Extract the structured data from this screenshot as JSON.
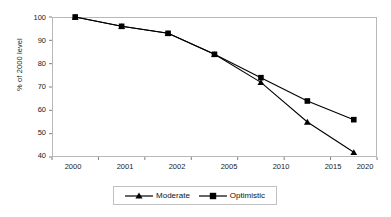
{
  "chart_data": {
    "type": "line",
    "title": "",
    "xlabel": "",
    "ylabel": "% of 2000 level",
    "categories": [
      "2000",
      "2001",
      "2002",
      "2005",
      "2010",
      "2015",
      "2020"
    ],
    "x_numeric": [
      2000,
      2001,
      2002,
      2005,
      2010,
      2015,
      2020
    ],
    "series": [
      {
        "name": "Moderate",
        "marker": "triangle",
        "color": "#000000",
        "values": [
          100,
          96,
          93,
          84,
          72,
          55,
          42
        ]
      },
      {
        "name": "Optimistic",
        "marker": "square",
        "color": "#000000",
        "values": [
          100,
          96,
          93,
          84,
          74,
          64,
          56
        ]
      }
    ],
    "ylim": [
      40,
      100
    ],
    "yticks": [
      40,
      50,
      60,
      70,
      80,
      90,
      100
    ],
    "ytick_labels": [
      "40",
      "50",
      "60",
      "70",
      "80",
      "90",
      "100"
    ],
    "grid": false,
    "legend_position": "bottom",
    "plot_border_color": "#b8b8b8",
    "axis_color": "#808080",
    "text_color": "#1a1a1a"
  },
  "legend": {
    "items": [
      {
        "label": "Moderate",
        "marker": "triangle-marker"
      },
      {
        "label": "Optimistic",
        "marker": "square-marker"
      }
    ]
  }
}
